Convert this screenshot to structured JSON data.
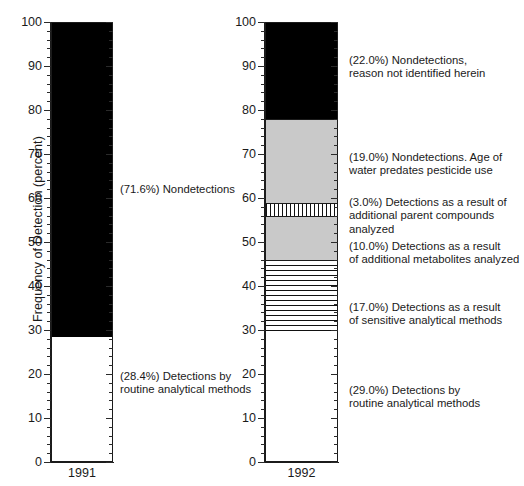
{
  "chart_data": {
    "type": "bar",
    "title": "",
    "subtitle": "",
    "xlabel": "",
    "ylabel": "Frequency of Detection (percent)",
    "ylim": [
      0,
      100
    ],
    "grid": false,
    "legend_position": "annotations-right-of-each-bar",
    "stacked": true,
    "categories": [
      "1991",
      "1992"
    ],
    "y_ticks": [
      0,
      10,
      20,
      30,
      40,
      50,
      60,
      70,
      80,
      90,
      100
    ],
    "y_tick_labels": [
      "0",
      "10",
      "20",
      "30",
      "40",
      "50",
      "60",
      "70",
      "80",
      "90",
      "100"
    ],
    "y_minor_tick_step": 2,
    "series": [
      {
        "name": "1991",
        "segments": [
          {
            "value": 28.4,
            "label": "(28.4%) Detections by\nroutine analytical methods",
            "fill": "white",
            "from": 0,
            "to": 28.4
          },
          {
            "value": 71.6,
            "label": "(71.6%) Nondetections",
            "fill": "black",
            "from": 28.4,
            "to": 100
          }
        ]
      },
      {
        "name": "1992",
        "segments": [
          {
            "value": 29.0,
            "label": "(29.0%) Detections by\nroutine analytical methods",
            "fill": "white",
            "from": 0,
            "to": 29.0
          },
          {
            "value": 17.0,
            "label": "(17.0%) Detections as a result\nof sensitive analytical methods",
            "fill": "horizontal-stripes",
            "from": 29.0,
            "to": 46.0
          },
          {
            "value": 10.0,
            "label": "(10.0%) Detections as a result\nof additional metabolites analyzed",
            "fill": "gray",
            "from": 46.0,
            "to": 56.0
          },
          {
            "value": 3.0,
            "label": "(3.0%) Detections as a result of\nadditional parent compounds analyzed",
            "fill": "vertical-stripes",
            "from": 56.0,
            "to": 59.0
          },
          {
            "value": 19.0,
            "label": "(19.0%) Nondetections. Age of\nwater predates pesticide use",
            "fill": "gray",
            "from": 59.0,
            "to": 78.0
          },
          {
            "value": 22.0,
            "label": "(22.0%) Nondetections,\nreason not identified herein",
            "fill": "black",
            "from": 78.0,
            "to": 100
          }
        ]
      }
    ],
    "colors": {
      "black": "#000000",
      "gray": "#c9c9c9",
      "white": "#ffffff",
      "axis": "#1b1b1b",
      "text": "#1a1a1a"
    }
  }
}
